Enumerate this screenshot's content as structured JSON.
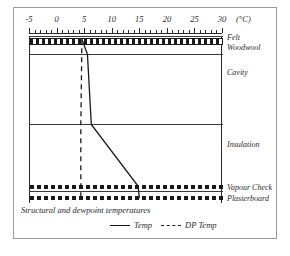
{
  "figure": {
    "caption": "Structural and dewpoint temperatures"
  },
  "axis": {
    "unit_label": "(°C)",
    "tick_labels": [
      "-5",
      "0",
      "5",
      "10",
      "15",
      "20",
      "25",
      "30"
    ],
    "min": -5,
    "max": 30,
    "major_step": 5,
    "minor_step": 1
  },
  "layers": [
    {
      "name": "Felt"
    },
    {
      "name": "Woodwool"
    },
    {
      "name": "Cavity"
    },
    {
      "name": "Insulation"
    },
    {
      "name": "Vapour Check"
    },
    {
      "name": "Plasterboard"
    }
  ],
  "legend": {
    "temp_label": "Temp",
    "dp_label": "DP Temp"
  },
  "chart_data": {
    "type": "line",
    "title": "Structural and dewpoint temperatures",
    "xlabel": "(°C)",
    "ylabel": "",
    "xlim": [
      -5,
      30
    ],
    "grid": false,
    "legend_position": "bottom",
    "orientation": "vertical-section",
    "x_tick_values": [
      -5,
      0,
      5,
      10,
      15,
      20,
      25,
      30
    ],
    "layer_boundaries": [
      {
        "name": "Felt",
        "depth": 0.0
      },
      {
        "name": "Woodwool",
        "depth": 0.04
      },
      {
        "name": "Cavity",
        "depth": 0.11
      },
      {
        "name": "Insulation",
        "depth": 0.53
      },
      {
        "name": "Vapour Check",
        "depth": 0.9
      },
      {
        "name": "Plasterboard",
        "depth": 0.95
      }
    ],
    "series": [
      {
        "name": "Temp",
        "style": "solid",
        "color": "#1a1a1a",
        "points": [
          {
            "depth": 0.02,
            "value": 4.6
          },
          {
            "depth": 0.11,
            "value": 5.6
          },
          {
            "depth": 0.53,
            "value": 6.3
          },
          {
            "depth": 0.9,
            "value": 14.8
          },
          {
            "depth": 0.97,
            "value": 15.0
          }
        ]
      },
      {
        "name": "DP Temp",
        "style": "dashed",
        "color": "#1a1a1a",
        "points": [
          {
            "depth": 0.02,
            "value": 4.6
          },
          {
            "depth": 0.53,
            "value": 4.4
          },
          {
            "depth": 0.9,
            "value": 4.4
          },
          {
            "depth": 0.97,
            "value": 4.4
          }
        ]
      }
    ]
  }
}
